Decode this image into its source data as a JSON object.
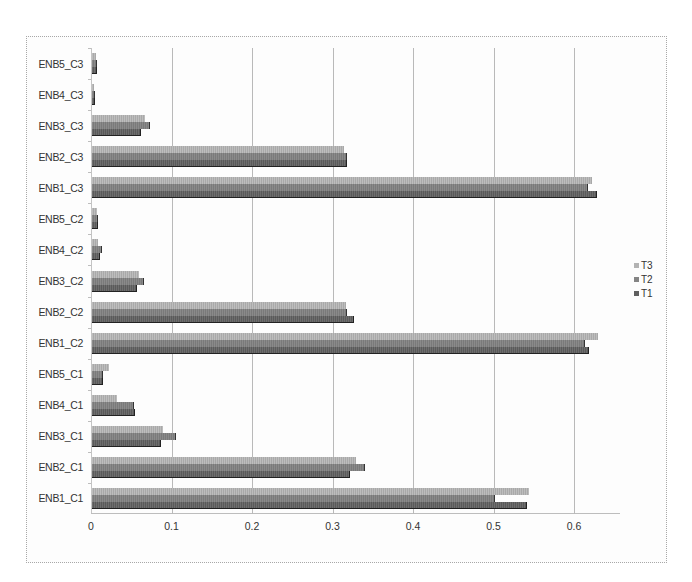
{
  "chart_data": {
    "type": "bar",
    "orientation": "horizontal",
    "title": "",
    "xlabel": "",
    "ylabel": "",
    "xlim": [
      0,
      0.65
    ],
    "x_ticks": [
      "0",
      "0.1",
      "0.2",
      "0.3",
      "0.4",
      "0.5",
      "0.6"
    ],
    "grid": true,
    "legend_position": "right",
    "categories": [
      "ENB1_C1",
      "ENB2_C1",
      "ENB3_C1",
      "ENB4_C1",
      "ENB5_C1",
      "ENB1_C2",
      "ENB2_C2",
      "ENB3_C2",
      "ENB4_C2",
      "ENB5_C2",
      "ENB1_C3",
      "ENB2_C3",
      "ENB3_C3",
      "ENB4_C3",
      "ENB5_C3"
    ],
    "series": [
      {
        "name": "T1",
        "color": "#5f5f5f",
        "values": [
          0.54,
          0.32,
          0.086,
          0.054,
          0.014,
          0.617,
          0.325,
          0.056,
          0.01,
          0.007,
          0.627,
          0.317,
          0.061,
          0.004,
          0.006
        ]
      },
      {
        "name": "T2",
        "color": "#848484",
        "values": [
          0.5,
          0.339,
          0.104,
          0.052,
          0.014,
          0.613,
          0.317,
          0.065,
          0.012,
          0.007,
          0.616,
          0.317,
          0.072,
          0.004,
          0.006
        ]
      },
      {
        "name": "T3",
        "color": "#b3b3b3",
        "values": [
          0.543,
          0.328,
          0.088,
          0.031,
          0.021,
          0.629,
          0.315,
          0.058,
          0.008,
          0.006,
          0.621,
          0.313,
          0.066,
          0.003,
          0.005
        ]
      }
    ]
  },
  "legend": {
    "items": [
      {
        "label": "T3",
        "color": "#b3b3b3"
      },
      {
        "label": "T2",
        "color": "#848484"
      },
      {
        "label": "T1",
        "color": "#5f5f5f"
      }
    ]
  }
}
